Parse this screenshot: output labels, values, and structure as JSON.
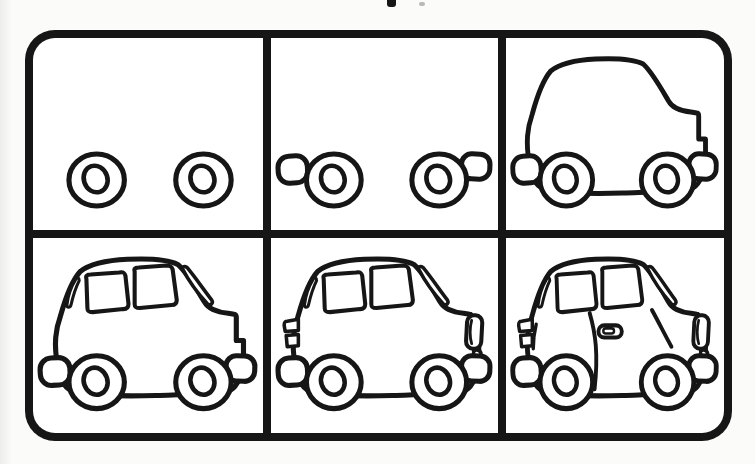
{
  "colors": {
    "ink": "#161616",
    "paper": "#ffffff",
    "page_background": "#fbfbfa",
    "frame_border": "#161616"
  },
  "artifacts": {
    "top_edge_text_fragment": "partially cropped text mark at top center"
  },
  "tutorial": {
    "subject": "car line drawing, six cumulative steps",
    "grid": {
      "rows": 2,
      "cols": 3
    },
    "steps": [
      {
        "step": 1,
        "name": "step-1",
        "shows": [
          "wheels"
        ],
        "description": "two wheels with inner hubs"
      },
      {
        "step": 2,
        "name": "step-2",
        "shows": [
          "wheels",
          "bumpers"
        ],
        "description": "rear and front bumper stubs added beside wheels"
      },
      {
        "step": 3,
        "name": "step-3",
        "shows": [
          "body",
          "bumpers",
          "wheels"
        ],
        "description": "car body outline with stepped hood added"
      },
      {
        "step": 4,
        "name": "step-4",
        "shows": [
          "body",
          "windows",
          "bumpers",
          "wheels"
        ],
        "description": "rear pillar sliver, two side windows and windshield added"
      },
      {
        "step": 5,
        "name": "step-5",
        "shows": [
          "body",
          "windows",
          "lights",
          "bumpers",
          "wheels"
        ],
        "description": "headlight capsule, front hook and tail-light stack added"
      },
      {
        "step": 6,
        "name": "step-6",
        "shows": [
          "body",
          "windows",
          "lights",
          "details",
          "bumpers",
          "wheels"
        ],
        "description": "door line, door handle, hood crease and rear stroke added"
      }
    ]
  }
}
